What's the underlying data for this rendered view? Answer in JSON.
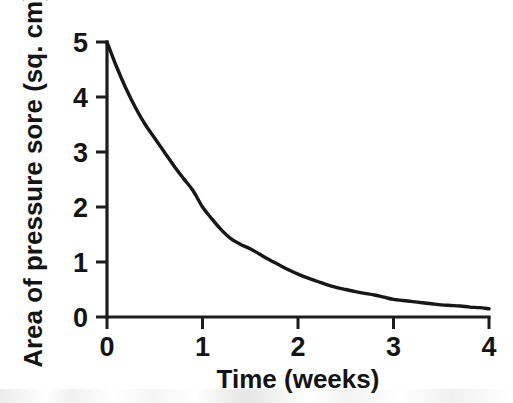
{
  "chart_data": {
    "type": "line",
    "title": "",
    "subtitle": "",
    "xlabel": "Time (weeks)",
    "ylabel": "Area of pressure sore (sq. cm)",
    "xlim": [
      0,
      4
    ],
    "ylim": [
      0,
      5
    ],
    "xticks": [
      0,
      1,
      2,
      3,
      4
    ],
    "xtick_labels": [
      "0",
      "1",
      "2",
      "3",
      "4"
    ],
    "yticks": [
      0,
      1,
      2,
      3,
      4,
      5
    ],
    "ytick_labels": [
      "0",
      "1",
      "2",
      "3",
      "4",
      "5"
    ],
    "grid": false,
    "legend": false,
    "legend_position": "none",
    "line_color": "#171717",
    "background_color": "#ffffff",
    "series": [
      {
        "name": "Area of pressure sore",
        "x": [
          0,
          0.1,
          0.2,
          0.3,
          0.4,
          0.5,
          0.6,
          0.7,
          0.8,
          0.9,
          1.0,
          1.1,
          1.2,
          1.3,
          1.4,
          1.5,
          1.6,
          1.7,
          1.8,
          1.9,
          2.0,
          2.1,
          2.2,
          2.3,
          2.4,
          2.5,
          2.6,
          2.7,
          2.8,
          2.9,
          3.0,
          3.1,
          3.2,
          3.3,
          3.4,
          3.5,
          3.6,
          3.7,
          3.8,
          3.9,
          4.0
        ],
        "values": [
          5.0,
          4.55,
          4.15,
          3.8,
          3.5,
          3.25,
          3.0,
          2.75,
          2.52,
          2.3,
          2.0,
          1.78,
          1.58,
          1.42,
          1.32,
          1.24,
          1.14,
          1.04,
          0.95,
          0.86,
          0.78,
          0.71,
          0.65,
          0.59,
          0.54,
          0.5,
          0.46,
          0.43,
          0.4,
          0.36,
          0.32,
          0.3,
          0.28,
          0.26,
          0.24,
          0.22,
          0.21,
          0.2,
          0.18,
          0.17,
          0.15
        ]
      }
    ],
    "annotations": []
  },
  "figure": {
    "caption": ""
  }
}
